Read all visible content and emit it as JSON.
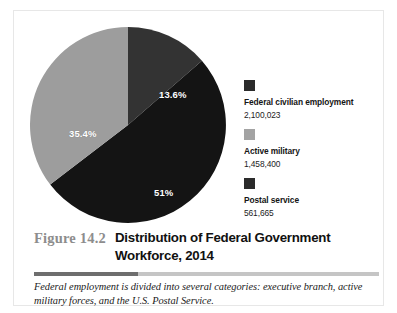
{
  "figure": {
    "number": "Figure 14.2",
    "title": "Distribution of Federal Government Workforce, 2014",
    "caption": "Federal employment is divided into several categories: executive branch, active military forces, and the U.S. Postal Service."
  },
  "legend": {
    "items": [
      {
        "label": "Federal civilian employment",
        "value": "2,100,023",
        "color": "#2b2b2b"
      },
      {
        "label": "Active military",
        "value": "1,458,400",
        "color": "#a3a3a3"
      },
      {
        "label": "Postal service",
        "value": "561,665",
        "color": "#2b2b2b"
      }
    ]
  },
  "slice_labels": {
    "civilian": "13.6%",
    "military": "35.4%",
    "postal": "51%"
  },
  "colors": {
    "civilian_slice": "#333333",
    "postal_slice": "#141414",
    "military_slice": "#9d9d9d",
    "figure_number": "#8d8d8d",
    "divider_dark": "#6e6e6e",
    "divider_light": "#c5c5c5"
  },
  "chart_data": {
    "type": "pie",
    "title": "Distribution of Federal Government Workforce, 2014",
    "subtitle": "",
    "xlabel": "",
    "ylabel": "",
    "grid": false,
    "legend_position": "right",
    "start_angle_deg": 0,
    "direction": "clockwise",
    "total": 4120088,
    "labels": [
      "Federal civilian employment",
      "Active military",
      "Postal service"
    ],
    "values": [
      2100023,
      1458400,
      561665
    ],
    "percent_labels": [
      "13.6%",
      "35.4%",
      "51%"
    ],
    "slices": [
      {
        "name": "Federal civilian employment",
        "value": 2100023,
        "percent": 13.6,
        "percent_label": "13.6%",
        "color": "#333333",
        "legend_swatch_color": "#2b2b2b",
        "order": 1
      },
      {
        "name": "Postal service",
        "value": 561665,
        "percent": 51,
        "percent_label": "51%",
        "color": "#141414",
        "legend_swatch_color": "#2b2b2b",
        "order": 2
      },
      {
        "name": "Active military",
        "value": 1458400,
        "percent": 35.4,
        "percent_label": "35.4%",
        "color": "#9d9d9d",
        "legend_swatch_color": "#a3a3a3",
        "order": 3
      }
    ],
    "annotations": [
      "Federal employment is divided into several categories: executive branch, active military forces, and the U.S. Postal Service."
    ]
  }
}
